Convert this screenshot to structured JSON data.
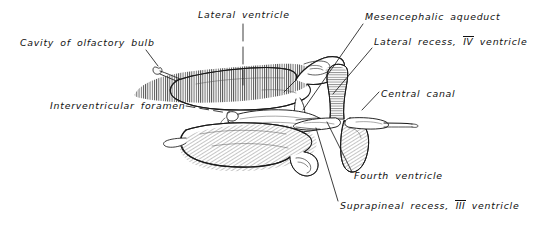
{
  "figure": {
    "background_color": "#ffffff",
    "ink_color": "#111111",
    "width": 537,
    "height": 227
  },
  "labels": {
    "cavity_of_olfactory_bulb": "Cavity of olfactory bulb",
    "lateral_ventricle": "Lateral ventricle",
    "mesencephalic_aqueduct": "Mesencephalic aqueduct",
    "lateral_recess_prefix": "Lateral recess,",
    "lateral_recess_numeral": "IV",
    "lateral_recess_suffix": "ventricle",
    "central_canal": "Central canal",
    "interventricular_foramen": "Interventricular foramen",
    "fourth_ventricle": "Fourth ventricle",
    "suprapineal_recess_prefix": "Suprapineal recess,",
    "suprapineal_recess_numeral": "III",
    "suprapineal_recess_suffix": "ventricle"
  },
  "structures": [
    "olfactory-bulb-cavity",
    "upper-lateral-ventricle",
    "lower-lateral-ventricle",
    "third-ventricle",
    "interventricular-foramen",
    "mesencephalic-aqueduct",
    "fourth-ventricle",
    "lateral-recess",
    "central-canal",
    "suprapineal-recess"
  ]
}
